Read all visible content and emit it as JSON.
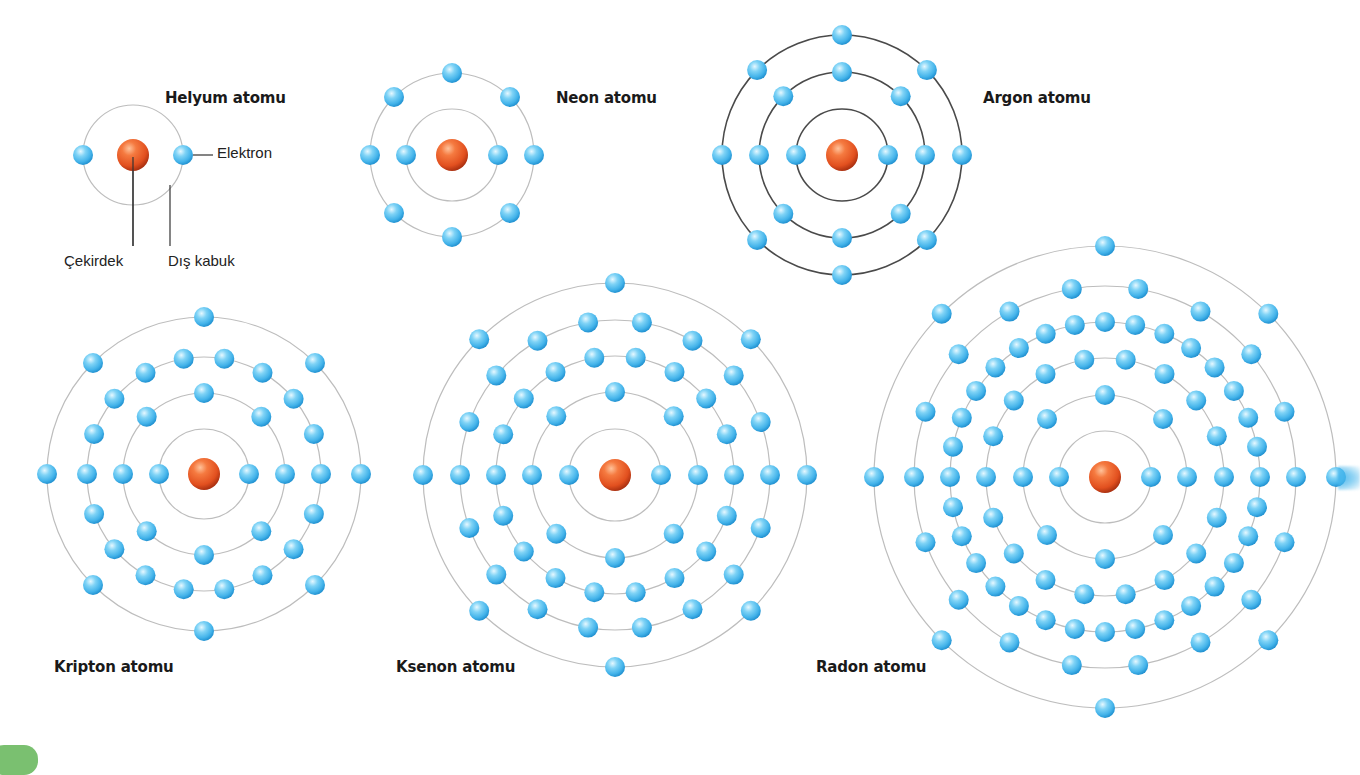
{
  "diagram": {
    "colors": {
      "orbit_light": "#bdbdbd",
      "orbit_dark": "#4a4a4a",
      "electron_highlight": "#e6f8ff",
      "electron_mid": "#55c4f2",
      "electron_dark": "#1f8fcf",
      "nucleus_highlight": "#ffc29a",
      "nucleus_mid": "#f0602a",
      "nucleus_dark": "#b73512",
      "leader_line": "#333333",
      "corner_tab": "#7ac070"
    },
    "electron_radius": 10,
    "nucleus_radius": 16,
    "atoms": [
      {
        "name": "Helyum atomu",
        "element": "Helium",
        "cx": 133,
        "cy": 155,
        "shells": [
          2
        ],
        "radii": [
          50
        ],
        "orbit_style": "light",
        "label": {
          "text": "Helyum atomu",
          "x": 165,
          "y": 89
        }
      },
      {
        "name": "Neon atomu",
        "element": "Neon",
        "cx": 452,
        "cy": 155,
        "shells": [
          2,
          8
        ],
        "radii": [
          46,
          82
        ],
        "orbit_style": "light",
        "label": {
          "text": "Neon atomu",
          "x": 556,
          "y": 89
        }
      },
      {
        "name": "Argon atomu",
        "element": "Argon",
        "cx": 842,
        "cy": 155,
        "shells": [
          2,
          8,
          8
        ],
        "radii": [
          46,
          83,
          120
        ],
        "orbit_style": "dark",
        "label": {
          "text": "Argon atomu",
          "x": 983,
          "y": 89
        }
      },
      {
        "name": "Kripton atomu",
        "element": "Krypton",
        "cx": 204,
        "cy": 474,
        "shells": [
          2,
          8,
          18,
          8
        ],
        "radii": [
          45,
          81,
          117,
          157
        ],
        "orbit_style": "light",
        "label": {
          "text": "Kripton atomu",
          "x": 54,
          "y": 658
        }
      },
      {
        "name": "Ksenon atomu",
        "element": "Xenon",
        "cx": 615,
        "cy": 475,
        "shells": [
          2,
          8,
          18,
          18,
          8
        ],
        "radii": [
          46,
          83,
          119,
          155,
          192
        ],
        "orbit_style": "light",
        "label": {
          "text": "Ksenon atomu",
          "x": 396,
          "y": 658
        }
      },
      {
        "name": "Radon atomu",
        "element": "Radon",
        "cx": 1105,
        "cy": 477,
        "shells": [
          2,
          8,
          18,
          32,
          18,
          8
        ],
        "radii": [
          46,
          82,
          119,
          155,
          191,
          231
        ],
        "orbit_style": "light",
        "label": {
          "text": "Radon atomu",
          "x": 816,
          "y": 658
        }
      }
    ],
    "callouts": {
      "electron": {
        "text": "Elektron",
        "x": 217,
        "y": 143
      },
      "nucleus": {
        "text": "Çekirdek",
        "x": 64,
        "y": 251
      },
      "outer_shell": {
        "text": "Dış kabuk",
        "x": 168,
        "y": 251
      }
    }
  }
}
